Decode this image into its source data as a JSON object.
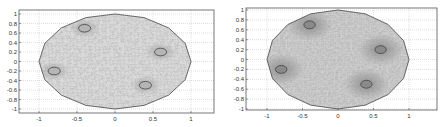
{
  "chart_data": [
    {
      "type": "scatter",
      "title": "",
      "description": "Triangular finite-element mesh of a unit disk domain with four circular holes (coarse mesh)",
      "xlabel": "",
      "ylabel": "",
      "xlim": [
        -1.3,
        1.3
      ],
      "ylim": [
        -1.1,
        1.1
      ],
      "xticks": [
        -1,
        -0.5,
        0,
        0.5,
        1
      ],
      "xtick_labels": [
        "-1",
        "-0.5",
        "0",
        "0.5",
        "1"
      ],
      "yticks": [
        1,
        0.8,
        0.6,
        0.4,
        0.2,
        0,
        -0.2,
        -0.4,
        -0.6,
        -0.8,
        -1
      ],
      "ytick_labels": [
        "1",
        "0.8",
        "0.6",
        "0.4",
        "0.2",
        "0",
        "-0.2",
        "-0.4",
        "-0.6",
        "-0.8",
        "-1"
      ],
      "grid": true,
      "legend": null,
      "domain_radius": 1,
      "holes": [
        {
          "x": -0.4,
          "y": 0.7,
          "r": 0.08
        },
        {
          "x": 0.6,
          "y": 0.2,
          "r": 0.08
        },
        {
          "x": -0.8,
          "y": -0.2,
          "r": 0.08
        },
        {
          "x": 0.4,
          "y": -0.5,
          "r": 0.08
        }
      ],
      "mesh_density": "coarse"
    },
    {
      "type": "scatter",
      "title": "",
      "description": "Refined triangular mesh of the same domain; darker regions show local refinement around the four holes",
      "xlabel": "",
      "ylabel": "",
      "xlim": [
        -1.1,
        1.4
      ],
      "ylim": [
        -1.05,
        1.05
      ],
      "xticks": [
        -1,
        -0.5,
        0,
        0.5,
        1
      ],
      "xtick_labels": [
        "-1",
        "-0.5",
        "0",
        "0.5",
        "1"
      ],
      "yticks": [
        1,
        0.8,
        0.6,
        0.4,
        0.2,
        0,
        -0.2,
        -0.4,
        -0.6,
        -0.8,
        -1
      ],
      "ytick_labels": [
        "1",
        "0.8",
        "0.6",
        "0.4",
        "0.2",
        "0",
        "-0.2",
        "-0.4",
        "-0.6",
        "-0.8",
        "-1"
      ],
      "grid": true,
      "legend": null,
      "domain_radius": 1,
      "holes": [
        {
          "x": -0.4,
          "y": 0.7,
          "r": 0.08
        },
        {
          "x": 0.6,
          "y": 0.2,
          "r": 0.08
        },
        {
          "x": -0.8,
          "y": -0.2,
          "r": 0.08
        },
        {
          "x": 0.4,
          "y": -0.5,
          "r": 0.08
        }
      ],
      "mesh_density": "fine"
    }
  ],
  "colors": {
    "frame": "#555555",
    "grid": "#bdbdbd",
    "boundary": "#444444",
    "mesh_fill": "#d9d9d9",
    "mesh_line": "#9a9a9a",
    "refine_shade": "#7a7a7a"
  },
  "plots": [
    {
      "frame": {
        "x": 19,
        "y": 10,
        "w": 195,
        "h": 103
      },
      "x_px": {
        "-1": 39,
        "1": 191
      },
      "y_px": {
        "1": 14,
        "-1": 109
      }
    },
    {
      "frame": {
        "x": 246,
        "y": 8,
        "w": 191,
        "h": 102
      },
      "x_px": {
        "-1": 267,
        "1": 409
      },
      "y_px": {
        "1": 10,
        "-1": 109
      }
    }
  ]
}
